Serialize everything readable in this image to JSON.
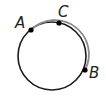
{
  "diagram": {
    "type": "circle-with-points",
    "circle": {
      "cx": 52,
      "cy": 56,
      "r": 34,
      "stroke": "#1a1a1a"
    },
    "highlighted_arc": {
      "from": "A",
      "via": "C",
      "to": "B",
      "stroke": "#8a8a8a"
    },
    "points": [
      {
        "label": "A",
        "x": 31,
        "y": 30,
        "label_x": 15,
        "label_y": 27
      },
      {
        "label": "C",
        "x": 59,
        "y": 23,
        "label_x": 58,
        "label_y": 16
      },
      {
        "label": "B",
        "x": 85,
        "y": 70,
        "label_x": 89,
        "label_y": 78
      }
    ]
  }
}
